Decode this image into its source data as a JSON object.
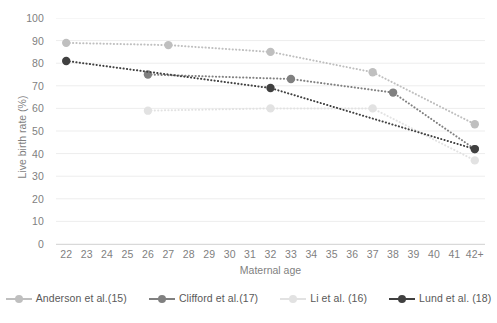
{
  "chart_data": {
    "type": "line",
    "title": "",
    "xlabel": "Maternal age",
    "ylabel": "Live birth rate (%)",
    "xlim": [
      22,
      42
    ],
    "ylim": [
      0,
      100
    ],
    "y_ticks": [
      0,
      10,
      20,
      30,
      40,
      50,
      60,
      70,
      80,
      90,
      100
    ],
    "x_tick_labels": [
      "22",
      "23",
      "24",
      "25",
      "26",
      "27",
      "28",
      "29",
      "30",
      "31",
      "32",
      "33",
      "34",
      "35",
      "36",
      "37",
      "38",
      "39",
      "40",
      "41",
      "42+"
    ],
    "grid": "horizontal",
    "legend_position": "bottom",
    "line_style": "dotted",
    "marker": "circle",
    "series": [
      {
        "name": "Anderson et al.(15)",
        "color": "#bfbfbf",
        "x": [
          22,
          27,
          32,
          37,
          42
        ],
        "values": [
          89,
          88,
          85,
          76,
          53
        ]
      },
      {
        "name": "Clifford et al.(17)",
        "color": "#808080",
        "x": [
          26,
          33,
          38,
          42
        ],
        "values": [
          75,
          73,
          67,
          42
        ]
      },
      {
        "name": "Li et al. (16)",
        "color": "#e2e2e2",
        "x": [
          26,
          32,
          37,
          42
        ],
        "values": [
          59,
          60,
          60,
          37
        ]
      },
      {
        "name": "Lund et al. (18)",
        "color": "#404040",
        "x": [
          22,
          32,
          42
        ],
        "values": [
          81,
          69,
          42
        ]
      }
    ]
  },
  "axis": {
    "y_title": "Live birth rate (%)",
    "x_title": "Maternal age"
  },
  "colors": {
    "grid": "#ededed",
    "axis_line": "#d9d9d9",
    "tick_text": "#7f7f7f",
    "legend_text": "#595959",
    "background": "#ffffff"
  }
}
